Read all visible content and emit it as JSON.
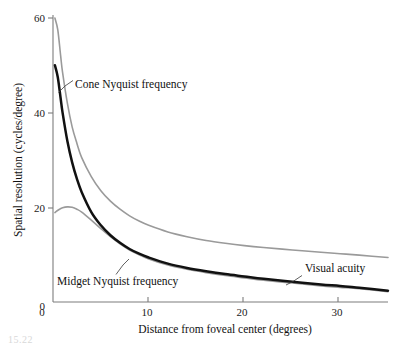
{
  "figure": {
    "caption_fragment": "15.22"
  },
  "chart_data": {
    "type": "line",
    "title": "",
    "xlabel": "Distance from foveal center (degrees)",
    "ylabel": "Spatial resolution (cycles/degree)",
    "xlim": [
      0,
      35
    ],
    "ylim": [
      0,
      60
    ],
    "xticks": [
      0,
      10,
      20,
      30
    ],
    "xtick_labels": [
      "0",
      "10",
      "20",
      "30"
    ],
    "yticks": [
      0,
      20,
      40,
      60
    ],
    "ytick_labels": [
      "0",
      "20",
      "40",
      "60"
    ],
    "grid": false,
    "legend_position": "inline-annotations",
    "series": [
      {
        "name": "Cone Nyquist frequency",
        "color": "#9a9a9a",
        "style": "thin-gray",
        "x": [
          0.2,
          0.5,
          0.8,
          1.0,
          1.5,
          2.0,
          2.5,
          3.0,
          4.0,
          5.0,
          6.0,
          7.0,
          8.0,
          9.0,
          10.0,
          12.0,
          14.0,
          16.0,
          18.0,
          20.0,
          22.0,
          25.0,
          28.0,
          30.0,
          32.0,
          35.0
        ],
        "values": [
          60.0,
          57.5,
          52.0,
          48.5,
          42.0,
          37.0,
          33.5,
          30.5,
          26.5,
          23.5,
          21.3,
          19.6,
          18.2,
          17.1,
          16.2,
          14.8,
          13.8,
          13.0,
          12.4,
          11.9,
          11.5,
          11.0,
          10.5,
          10.2,
          9.9,
          9.4
        ]
      },
      {
        "name": "Visual acuity",
        "color": "#111111",
        "style": "thick-black",
        "x": [
          0.2,
          0.5,
          0.8,
          1.0,
          1.5,
          2.0,
          2.5,
          3.0,
          4.0,
          5.0,
          6.0,
          7.0,
          8.0,
          9.0,
          10.0,
          12.0,
          14.0,
          16.0,
          18.0,
          20.0,
          22.0,
          25.0,
          28.0,
          30.0,
          32.0,
          35.0
        ],
        "values": [
          50.0,
          47.5,
          43.0,
          40.0,
          34.0,
          29.5,
          26.0,
          23.2,
          19.0,
          16.2,
          14.1,
          12.5,
          11.2,
          10.2,
          9.4,
          8.1,
          7.2,
          6.5,
          5.9,
          5.4,
          4.9,
          4.3,
          3.7,
          3.4,
          3.0,
          2.4
        ]
      },
      {
        "name": "Midget Nyquist frequency",
        "color": "#9a9a9a",
        "style": "thin-gray",
        "x": [
          0.2,
          0.6,
          1.0,
          1.5,
          2.0,
          2.5,
          3.0,
          4.0,
          5.0,
          6.0,
          7.0,
          8.0,
          9.0,
          10.0,
          12.0,
          14.0,
          16.0,
          18.0,
          20.0,
          22.0,
          25.0,
          28.0,
          30.0,
          32.0,
          35.0
        ],
        "values": [
          18.9,
          19.5,
          19.9,
          20.1,
          20.0,
          19.6,
          19.0,
          17.3,
          15.5,
          13.8,
          12.3,
          11.0,
          10.0,
          9.1,
          7.8,
          6.9,
          6.2,
          5.6,
          5.1,
          4.6,
          4.0,
          3.4,
          3.1,
          2.8,
          2.2
        ]
      }
    ],
    "annotations": [
      {
        "id": "cone-nyquist",
        "text": "Cone Nyquist frequency",
        "text_x": 75,
        "text_y": 88,
        "leader": "M58.5,92.5 L65,86 L73,80.5"
      },
      {
        "id": "midget-nyquist",
        "text": "Midget Nyquist frequency",
        "text_x": 57,
        "text_y": 285,
        "leader": "M116,274.5 L123,265 L129,259"
      },
      {
        "id": "visual-acuity",
        "text": "Visual acuity",
        "text_x": 305,
        "text_y": 272,
        "leader": "M302,275.5 L293,281.5 L286,285"
      }
    ]
  }
}
